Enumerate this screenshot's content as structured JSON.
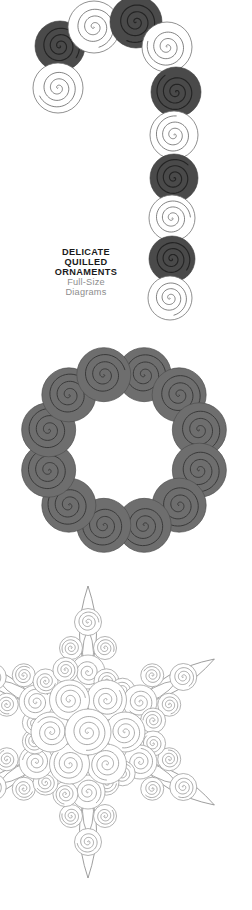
{
  "page": {
    "background": "#ffffff",
    "width": 252,
    "height": 910,
    "kind": "quilled-paper-ornament-pattern-sheet"
  },
  "caption": {
    "line1": "DELICATE",
    "line2": "QUILLED",
    "line3": "ORNAMENTS",
    "line4": "Full-Size",
    "line5": "Diagrams",
    "title_color": "#1a1a1a",
    "subtitle_color": "#8d8d8d"
  },
  "palette": {
    "dark_coil": "#4a4a4a",
    "mid_coil": "#6e6e6e",
    "open_coil_fill": "#ffffff",
    "outline": "#6b6b6b",
    "spiral_stroke": "#5a5a5a",
    "light_outline": "#9a9a9a"
  },
  "diagrams": [
    {
      "id": "candycane",
      "name": "candy-cane-ornament",
      "label": "Candy Cane",
      "coil_count": 12,
      "coils": [
        {
          "cx": 60,
          "cy": 46,
          "r": 25,
          "tone": "dark",
          "dir": 1
        },
        {
          "cx": 94,
          "cy": 27,
          "r": 26,
          "tone": "open",
          "dir": 1
        },
        {
          "cx": 136,
          "cy": 22,
          "r": 26,
          "tone": "dark",
          "dir": 1
        },
        {
          "cx": 58,
          "cy": 88,
          "r": 25,
          "tone": "open",
          "dir": 1
        },
        {
          "cx": 167,
          "cy": 47,
          "r": 25,
          "tone": "open",
          "dir": 1
        },
        {
          "cx": 176,
          "cy": 92,
          "r": 25,
          "tone": "dark",
          "dir": 1
        },
        {
          "cx": 174,
          "cy": 135,
          "r": 24,
          "tone": "open",
          "dir": 1
        },
        {
          "cx": 174,
          "cy": 178,
          "r": 24,
          "tone": "dark",
          "dir": 1
        },
        {
          "cx": 172,
          "cy": 218,
          "r": 23,
          "tone": "open",
          "dir": 1
        },
        {
          "cx": 172,
          "cy": 259,
          "r": 23,
          "tone": "dark",
          "dir": 1
        },
        {
          "cx": 170,
          "cy": 298,
          "r": 22,
          "tone": "open",
          "dir": 1
        }
      ]
    },
    {
      "id": "wreath",
      "name": "wreath-ornament",
      "label": "Wreath",
      "coil_count": 12,
      "ring": {
        "cx": 124,
        "cy": 120,
        "ring_radius": 78,
        "coil_radius": 27,
        "tone": "mid"
      }
    },
    {
      "id": "snowflake",
      "name": "snowflake-ornament",
      "label": "Snowflake",
      "center": {
        "cx": 88,
        "cy": 172
      },
      "arm_count": 6,
      "tone": "open"
    }
  ]
}
